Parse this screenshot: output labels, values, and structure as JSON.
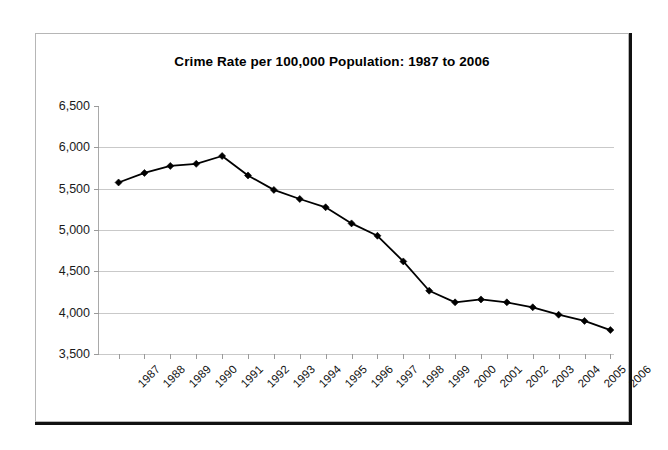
{
  "chart_data": {
    "type": "line",
    "title": "Crime Rate per 100,000 Population: 1987 to 2006",
    "xlabel": "",
    "ylabel": "",
    "categories": [
      "1987",
      "1988",
      "1989",
      "1990",
      "1991",
      "1992",
      "1993",
      "1994",
      "1995",
      "1996",
      "1997",
      "1998",
      "1999",
      "2000",
      "2001",
      "2002",
      "2003",
      "2004",
      "2005",
      "2006"
    ],
    "values": [
      5575,
      5690,
      5775,
      5800,
      5895,
      5660,
      5485,
      5375,
      5275,
      5080,
      4930,
      4620,
      4265,
      4125,
      4160,
      4125,
      4065,
      3975,
      3900,
      3790
    ],
    "ylim": [
      3500,
      6500
    ],
    "ytick_labels": [
      "6,500",
      "6,000",
      "5,500",
      "5,000",
      "4,500",
      "4,000",
      "3,500"
    ],
    "ytick_values": [
      6500,
      6000,
      5500,
      5000,
      4500,
      4000,
      3500
    ],
    "grid": "horizontal",
    "legend": "none",
    "marker": "diamond",
    "series_color": "#000000",
    "gridline_color": "#c9c9c9",
    "xtick_label_rotation": -45
  }
}
